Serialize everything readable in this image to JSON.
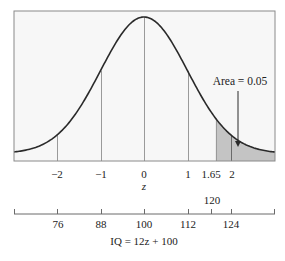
{
  "chart_data": {
    "type": "area",
    "title": "",
    "distribution": "normal",
    "mean": 0,
    "sd": 1,
    "xlabel": "z",
    "xlim": [
      -3,
      3
    ],
    "z_ticks": [
      -2,
      -1,
      0,
      1,
      1.65,
      2
    ],
    "z_tick_labels": [
      "−2",
      "−1",
      "0",
      "1",
      "1.65",
      "2"
    ],
    "vertical_lines_z": [
      -2,
      -1,
      0,
      1,
      1.65,
      2
    ],
    "shaded_region": {
      "from_z": 1.65,
      "to_z": 3,
      "area": 0.05
    },
    "annotation": {
      "text": "Area = 0.05",
      "arrow_target_z": 2.2
    },
    "secondary_axis": {
      "label": "IQ = 12z + 100",
      "ticks": [
        76,
        88,
        100,
        112,
        120,
        124
      ],
      "tick_labels": [
        "76",
        "88",
        "100",
        "112",
        "120",
        "124"
      ],
      "transform": {
        "slope": 12,
        "intercept": 100
      }
    },
    "grid": false,
    "legend": null
  },
  "labels": {
    "z_axis_title": "z",
    "annotation": "Area = 0.05",
    "iq_formula": "IQ = 12z + 100",
    "iq_120": "120",
    "z": [
      "−2",
      "−1",
      "0",
      "1",
      "1.65",
      "2"
    ],
    "iq": [
      "76",
      "88",
      "100",
      "112",
      "124"
    ]
  },
  "colors": {
    "curve": "#2a2a2a",
    "shade": "#c4c4c4",
    "frame": "#8a8a8a",
    "vline": "#9a9a9a",
    "background": "#f7f7f7"
  }
}
